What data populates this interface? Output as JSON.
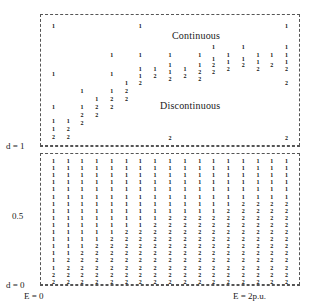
{
  "figure": {
    "type": "scatter-digit-grid",
    "regions": {
      "continuous_label": "Continuous",
      "discontinuous_label": "Discontinuous"
    },
    "axes": {
      "y_top_label": "d = 1",
      "y_mid_label": "0.5",
      "y_bottom_label": "d = 0",
      "x_left_label": "E = 0",
      "x_right_label": "E = 2p.u."
    }
  },
  "chart_data": {
    "type": "scatter",
    "title": "",
    "xlabel": "E",
    "ylabel": "d",
    "xlim": [
      0,
      2
    ],
    "ylim": [
      0,
      1
    ],
    "x_tick_labels": [
      "E = 0",
      "E = 2p.u."
    ],
    "y_tick_labels": [
      "d = 0",
      "0.5",
      "d = 1"
    ],
    "grid": false,
    "legend": false,
    "annotations": [
      {
        "text": "Continuous",
        "x": 1.02,
        "y": 0.88
      },
      {
        "text": "Discontinuous",
        "x": 0.93,
        "y": 0.36
      }
    ],
    "marker_encoding": {
      "1": "solution branch 1",
      "2": "solution branch 2"
    },
    "columns_x": [
      0.06,
      0.18,
      0.29,
      0.41,
      0.53,
      0.65,
      0.76,
      0.88,
      1.0,
      1.12,
      1.24,
      1.35,
      1.47,
      1.59,
      1.71,
      1.82,
      1.94
    ],
    "upper_panel": {
      "y_range_px": [
        14,
        146
      ],
      "points": [
        {
          "col": 0,
          "y": 23,
          "v": "1"
        },
        {
          "col": 0,
          "y": 71,
          "v": "1"
        },
        {
          "col": 0,
          "y": 104,
          "v": "1"
        },
        {
          "col": 0,
          "y": 118,
          "v": "1"
        },
        {
          "col": 0,
          "y": 126,
          "v": "1"
        },
        {
          "col": 0,
          "y": 134,
          "v": "2"
        },
        {
          "col": 1,
          "y": 118,
          "v": "1"
        },
        {
          "col": 1,
          "y": 126,
          "v": "2"
        },
        {
          "col": 1,
          "y": 134,
          "v": "2"
        },
        {
          "col": 2,
          "y": 88,
          "v": "1"
        },
        {
          "col": 2,
          "y": 104,
          "v": "1"
        },
        {
          "col": 2,
          "y": 112,
          "v": "2"
        },
        {
          "col": 2,
          "y": 120,
          "v": "2"
        },
        {
          "col": 3,
          "y": 96,
          "v": "1"
        },
        {
          "col": 3,
          "y": 104,
          "v": "2"
        },
        {
          "col": 3,
          "y": 112,
          "v": "2"
        },
        {
          "col": 4,
          "y": 52,
          "v": "1"
        },
        {
          "col": 4,
          "y": 71,
          "v": "1"
        },
        {
          "col": 4,
          "y": 88,
          "v": "1"
        },
        {
          "col": 4,
          "y": 96,
          "v": "2"
        },
        {
          "col": 4,
          "y": 104,
          "v": "2"
        },
        {
          "col": 5,
          "y": 80,
          "v": "1"
        },
        {
          "col": 5,
          "y": 88,
          "v": "2"
        },
        {
          "col": 5,
          "y": 96,
          "v": "2"
        },
        {
          "col": 6,
          "y": 23,
          "v": "1"
        },
        {
          "col": 6,
          "y": 52,
          "v": "1"
        },
        {
          "col": 6,
          "y": 66,
          "v": "1"
        },
        {
          "col": 6,
          "y": 73,
          "v": "1"
        },
        {
          "col": 6,
          "y": 80,
          "v": "2"
        },
        {
          "col": 7,
          "y": 66,
          "v": "1"
        },
        {
          "col": 7,
          "y": 73,
          "v": "2"
        },
        {
          "col": 8,
          "y": 52,
          "v": "1"
        },
        {
          "col": 8,
          "y": 62,
          "v": "1"
        },
        {
          "col": 8,
          "y": 69,
          "v": "1"
        },
        {
          "col": 8,
          "y": 76,
          "v": "2"
        },
        {
          "col": 8,
          "y": 135,
          "v": "2"
        },
        {
          "col": 9,
          "y": 66,
          "v": "1"
        },
        {
          "col": 9,
          "y": 73,
          "v": "2"
        },
        {
          "col": 10,
          "y": 52,
          "v": "1"
        },
        {
          "col": 10,
          "y": 62,
          "v": "1"
        },
        {
          "col": 10,
          "y": 69,
          "v": "2"
        },
        {
          "col": 10,
          "y": 76,
          "v": "2"
        },
        {
          "col": 11,
          "y": 44,
          "v": "1"
        },
        {
          "col": 11,
          "y": 56,
          "v": "1"
        },
        {
          "col": 11,
          "y": 62,
          "v": "2"
        },
        {
          "col": 11,
          "y": 69,
          "v": "2"
        },
        {
          "col": 12,
          "y": 52,
          "v": "1"
        },
        {
          "col": 12,
          "y": 59,
          "v": "1"
        },
        {
          "col": 12,
          "y": 66,
          "v": "2"
        },
        {
          "col": 13,
          "y": 44,
          "v": "1"
        },
        {
          "col": 13,
          "y": 56,
          "v": "1"
        },
        {
          "col": 13,
          "y": 62,
          "v": "2"
        },
        {
          "col": 14,
          "y": 52,
          "v": "1"
        },
        {
          "col": 14,
          "y": 59,
          "v": "1"
        },
        {
          "col": 14,
          "y": 66,
          "v": "2"
        },
        {
          "col": 15,
          "y": 52,
          "v": "1"
        },
        {
          "col": 15,
          "y": 62,
          "v": "2"
        },
        {
          "col": 16,
          "y": 23,
          "v": "1"
        },
        {
          "col": 16,
          "y": 44,
          "v": "1"
        },
        {
          "col": 16,
          "y": 52,
          "v": "1"
        },
        {
          "col": 16,
          "y": 59,
          "v": "1"
        },
        {
          "col": 16,
          "y": 66,
          "v": "2"
        },
        {
          "col": 16,
          "y": 80,
          "v": "2"
        },
        {
          "col": 16,
          "y": 135,
          "v": "2"
        }
      ]
    },
    "lower_panel": {
      "y_range_px": [
        153,
        285
      ],
      "row_count": 18,
      "row_step_px": 7.1,
      "row_start_px": 158,
      "grid": [
        [
          "1",
          "1",
          "1",
          "1",
          "1",
          "1",
          "1",
          "1",
          "1",
          "1",
          "1",
          "1",
          "1",
          "1",
          "1",
          "1",
          "1"
        ],
        [
          "1",
          "1",
          "1",
          "1",
          "1",
          "1",
          "1",
          "1",
          "1",
          "1",
          "1",
          "1",
          "1",
          "1",
          "1",
          "1",
          "1"
        ],
        [
          "1",
          "1",
          "1",
          "1",
          "1",
          "1",
          "1",
          "1",
          "1",
          "1",
          "1",
          "1",
          "1",
          "1",
          "1",
          "1",
          "1"
        ],
        [
          "1",
          "1",
          "1",
          "1",
          "1",
          "1",
          "1",
          "1",
          "1",
          "1",
          "1",
          "1",
          "1",
          "1",
          "1",
          "1",
          "1"
        ],
        [
          "1",
          "1",
          "1",
          "1",
          "1",
          "1",
          "1",
          "1",
          "1",
          "1",
          "1",
          "1",
          "1",
          "1",
          "1",
          "1",
          "1"
        ],
        [
          "1",
          "1",
          "1",
          "1",
          "1",
          "1",
          "1",
          "1",
          "1",
          "1",
          "1",
          "1",
          "1",
          "1",
          "1",
          "1",
          "1"
        ],
        [
          "1",
          "1",
          "1",
          "1",
          "1",
          "1",
          "1",
          "1",
          "1",
          "1",
          "1",
          "1",
          "1",
          "2",
          "2",
          "2",
          "2"
        ],
        [
          "1",
          "1",
          "1",
          "1",
          "1",
          "1",
          "1",
          "1",
          "1",
          "1",
          "1",
          "1",
          "2",
          "2",
          "2",
          "2",
          "2"
        ],
        [
          "1",
          "1",
          "1",
          "1",
          "1",
          "1",
          "1",
          "1",
          "2",
          "2",
          "2",
          "2",
          "2",
          "2",
          "2",
          "2",
          "2"
        ],
        [
          "1",
          "1",
          "1",
          "1",
          "1",
          "1",
          "1",
          "2",
          "2",
          "2",
          "2",
          "2",
          "2",
          "2",
          "2",
          "2",
          "2"
        ],
        [
          "1",
          "1",
          "1",
          "1",
          "1",
          "2",
          "2",
          "2",
          "2",
          "2",
          "2",
          "2",
          "2",
          "2",
          "2",
          "2",
          "2"
        ],
        [
          "1",
          "1",
          "1",
          "1",
          "2",
          "2",
          "2",
          "2",
          "2",
          "2",
          "2",
          "2",
          "2",
          "2",
          "2",
          "2",
          "2"
        ],
        [
          "1",
          "1",
          "1",
          "2",
          "2",
          "2",
          "2",
          "2",
          "2",
          "2",
          "2",
          "2",
          "2",
          "2",
          "2",
          "2",
          "2"
        ],
        [
          "1",
          "1",
          "2",
          "2",
          "2",
          "2",
          "2",
          "2",
          "2",
          "2",
          "2",
          "2",
          "2",
          "2",
          "2",
          "2",
          "2"
        ],
        [
          "1",
          "2",
          "2",
          "2",
          "2",
          "2",
          "2",
          "2",
          "2",
          "2",
          "2",
          "2",
          "2",
          "2",
          "2",
          "2",
          "2"
        ],
        [
          "1",
          "2",
          "2",
          "2",
          "2",
          "2",
          "2",
          "2",
          "2",
          "2",
          "2",
          "2",
          "2",
          "2",
          "2",
          "2",
          "2"
        ],
        [
          "2",
          "2",
          "2",
          "2",
          "2",
          "2",
          "2",
          "2",
          "2",
          "2",
          "2",
          "2",
          "2",
          "2",
          "2",
          "2",
          "2"
        ],
        [
          "2",
          "2",
          "2",
          "2",
          "2",
          "2",
          "2",
          "2",
          "2",
          "2",
          "2",
          "2",
          "2",
          "2",
          "2",
          "2",
          "2"
        ]
      ]
    }
  }
}
